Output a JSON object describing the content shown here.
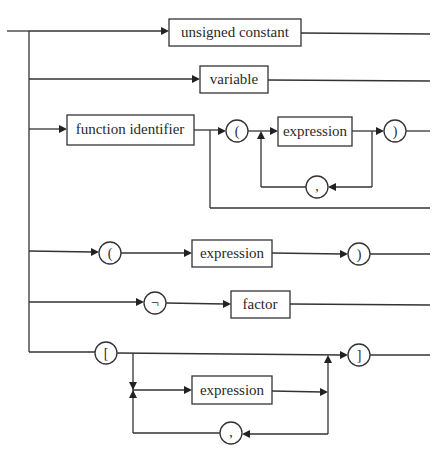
{
  "diagram": {
    "boxes": {
      "unsigned_constant": "unsigned constant",
      "variable": "variable",
      "function_identifier": "function identifier",
      "expression_args": "expression",
      "expression_paren": "expression",
      "factor": "factor",
      "expression_set": "expression"
    },
    "symbols": {
      "open_paren_args": "(",
      "close_paren_args": ")",
      "comma_args": ",",
      "open_paren": "(",
      "close_paren": ")",
      "not": "¬",
      "open_bracket": "[",
      "close_bracket": "]",
      "comma_set": ","
    },
    "colors": {
      "line": "#333333",
      "background": "#ffffff"
    }
  }
}
